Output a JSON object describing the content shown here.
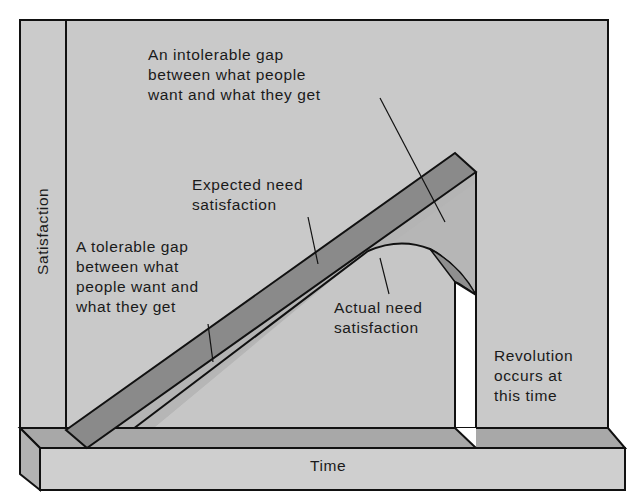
{
  "diagram": {
    "type": "J-curve theory of revolution (3D illustration)",
    "axes": {
      "y_label": "Satisfaction",
      "x_label": "Time"
    },
    "annotations": {
      "intolerable_gap": "An intolerable gap\nbetween what people\nwant and what they get",
      "expected_need": "Expected need\nsatisfaction",
      "tolerable_gap": "A tolerable gap\nbetween what\npeople want and\nwhat they get",
      "actual_need": "Actual need\nsatisfaction",
      "revolution": "Revolution\noccurs at\nthis time"
    },
    "colors": {
      "background_wall": "#c9c9c9",
      "ramp_dark": "#8a8a8a",
      "ramp_light": "#b4b4b4",
      "base_top": "#a8a8a8",
      "base_front": "#cfcfcf",
      "slot": "#ffffff",
      "outline": "#111111"
    }
  }
}
